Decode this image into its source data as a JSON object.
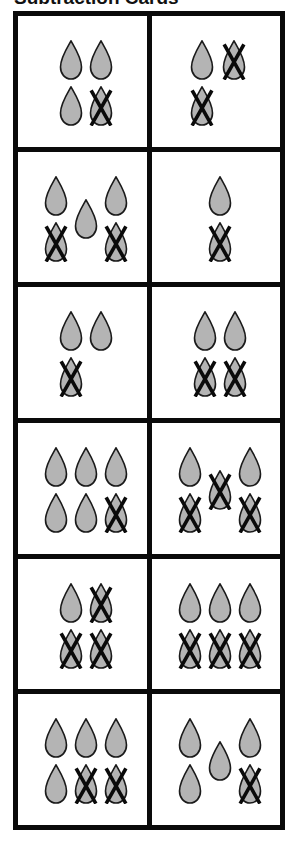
{
  "title": "Subtraction Cards",
  "colors": {
    "drop_fill": "#b4b4b4",
    "drop_stroke": "#1a1a1a",
    "cross": "#0a0a0a",
    "border": "#0a0a0a"
  },
  "cards": [
    {
      "id": "r1c1",
      "total": 4,
      "crossed": 1,
      "remaining": 3,
      "drops": [
        {
          "x": 41,
          "y": 24,
          "crossed": false
        },
        {
          "x": 71,
          "y": 24,
          "crossed": false
        },
        {
          "x": 41,
          "y": 70,
          "crossed": false
        },
        {
          "x": 71,
          "y": 70,
          "crossed": true
        }
      ]
    },
    {
      "id": "r1c2",
      "total": 3,
      "crossed": 2,
      "remaining": 1,
      "drops": [
        {
          "x": 38,
          "y": 24,
          "crossed": false
        },
        {
          "x": 70,
          "y": 24,
          "crossed": true
        },
        {
          "x": 38,
          "y": 70,
          "crossed": true
        }
      ]
    },
    {
      "id": "r2c1",
      "total": 5,
      "crossed": 2,
      "remaining": 3,
      "drops": [
        {
          "x": 26,
          "y": 24,
          "crossed": false
        },
        {
          "x": 86,
          "y": 24,
          "crossed": false
        },
        {
          "x": 56,
          "y": 47,
          "crossed": false
        },
        {
          "x": 26,
          "y": 70,
          "crossed": true
        },
        {
          "x": 86,
          "y": 70,
          "crossed": true
        }
      ]
    },
    {
      "id": "r2c2",
      "total": 2,
      "crossed": 1,
      "remaining": 1,
      "drops": [
        {
          "x": 56,
          "y": 24,
          "crossed": false
        },
        {
          "x": 56,
          "y": 70,
          "crossed": true
        }
      ]
    },
    {
      "id": "r3c1",
      "total": 3,
      "crossed": 1,
      "remaining": 2,
      "drops": [
        {
          "x": 41,
          "y": 24,
          "crossed": false
        },
        {
          "x": 71,
          "y": 24,
          "crossed": false
        },
        {
          "x": 41,
          "y": 70,
          "crossed": true
        }
      ]
    },
    {
      "id": "r3c2",
      "total": 4,
      "crossed": 2,
      "remaining": 2,
      "drops": [
        {
          "x": 41,
          "y": 24,
          "crossed": false
        },
        {
          "x": 71,
          "y": 24,
          "crossed": false
        },
        {
          "x": 41,
          "y": 70,
          "crossed": true
        },
        {
          "x": 71,
          "y": 70,
          "crossed": true
        }
      ]
    },
    {
      "id": "r4c1",
      "total": 6,
      "crossed": 1,
      "remaining": 5,
      "drops": [
        {
          "x": 26,
          "y": 24,
          "crossed": false
        },
        {
          "x": 56,
          "y": 24,
          "crossed": false
        },
        {
          "x": 86,
          "y": 24,
          "crossed": false
        },
        {
          "x": 26,
          "y": 70,
          "crossed": false
        },
        {
          "x": 56,
          "y": 70,
          "crossed": false
        },
        {
          "x": 86,
          "y": 70,
          "crossed": true
        }
      ]
    },
    {
      "id": "r4c2",
      "total": 5,
      "crossed": 3,
      "remaining": 2,
      "drops": [
        {
          "x": 26,
          "y": 24,
          "crossed": false
        },
        {
          "x": 86,
          "y": 24,
          "crossed": false
        },
        {
          "x": 56,
          "y": 47,
          "crossed": true
        },
        {
          "x": 26,
          "y": 70,
          "crossed": true
        },
        {
          "x": 86,
          "y": 70,
          "crossed": true
        }
      ]
    },
    {
      "id": "r5c1",
      "total": 4,
      "crossed": 3,
      "remaining": 1,
      "drops": [
        {
          "x": 41,
          "y": 24,
          "crossed": false
        },
        {
          "x": 71,
          "y": 24,
          "crossed": true
        },
        {
          "x": 41,
          "y": 70,
          "crossed": true
        },
        {
          "x": 71,
          "y": 70,
          "crossed": true
        }
      ]
    },
    {
      "id": "r5c2",
      "total": 6,
      "crossed": 3,
      "remaining": 3,
      "drops": [
        {
          "x": 26,
          "y": 24,
          "crossed": false
        },
        {
          "x": 56,
          "y": 24,
          "crossed": false
        },
        {
          "x": 86,
          "y": 24,
          "crossed": false
        },
        {
          "x": 26,
          "y": 70,
          "crossed": true
        },
        {
          "x": 56,
          "y": 70,
          "crossed": true
        },
        {
          "x": 86,
          "y": 70,
          "crossed": true
        }
      ]
    },
    {
      "id": "r6c1",
      "total": 6,
      "crossed": 2,
      "remaining": 4,
      "drops": [
        {
          "x": 26,
          "y": 24,
          "crossed": false
        },
        {
          "x": 56,
          "y": 24,
          "crossed": false
        },
        {
          "x": 86,
          "y": 24,
          "crossed": false
        },
        {
          "x": 26,
          "y": 70,
          "crossed": false
        },
        {
          "x": 56,
          "y": 70,
          "crossed": true
        },
        {
          "x": 86,
          "y": 70,
          "crossed": true
        }
      ]
    },
    {
      "id": "r6c2",
      "total": 5,
      "crossed": 1,
      "remaining": 4,
      "drops": [
        {
          "x": 26,
          "y": 24,
          "crossed": false
        },
        {
          "x": 86,
          "y": 24,
          "crossed": false
        },
        {
          "x": 56,
          "y": 47,
          "crossed": false
        },
        {
          "x": 26,
          "y": 70,
          "crossed": false
        },
        {
          "x": 86,
          "y": 70,
          "crossed": true
        }
      ]
    }
  ]
}
